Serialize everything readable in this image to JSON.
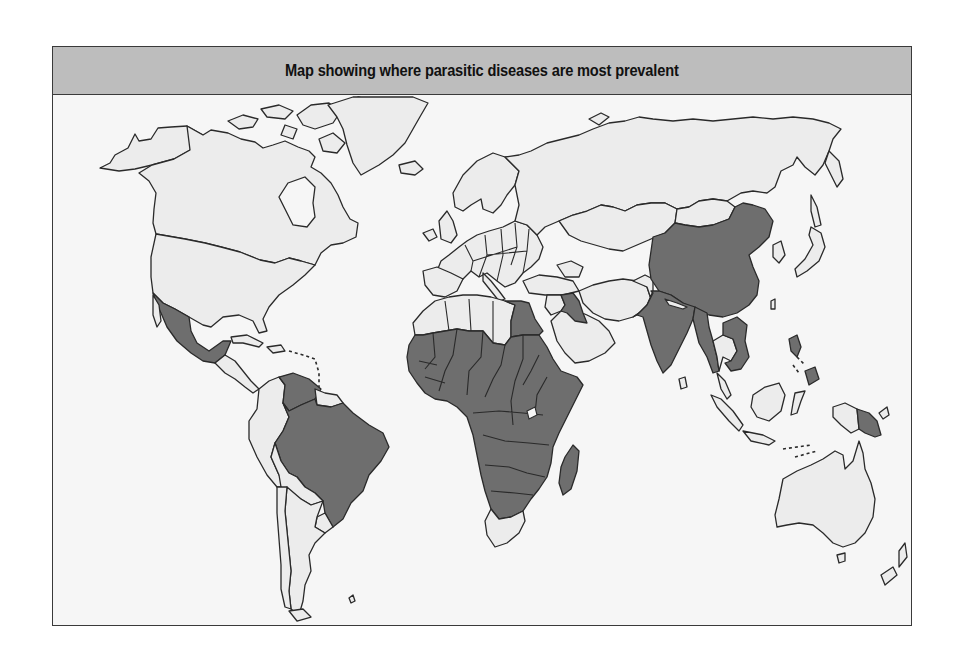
{
  "title": "Map showing where parasitic diseases are most prevalent",
  "map": {
    "projection": "world outline map",
    "legend": null,
    "colors": {
      "ocean": "#f6f6f6",
      "land_low_prevalence": "#ececec",
      "land_high_prevalence": "#6e6e6e",
      "header": "#bdbdbd",
      "outline": "#2a2a2a"
    },
    "high_prevalence_regions": [
      {
        "name": "Mexico",
        "continent": "North America"
      },
      {
        "name": "Venezuela",
        "continent": "South America"
      },
      {
        "name": "Brazil",
        "continent": "South America"
      },
      {
        "name": "Sub-Saharan Africa",
        "continent": "Africa"
      },
      {
        "name": "Egypt",
        "continent": "Africa"
      },
      {
        "name": "Madagascar",
        "continent": "Africa"
      },
      {
        "name": "Iraq",
        "continent": "Asia"
      },
      {
        "name": "India",
        "continent": "Asia"
      },
      {
        "name": "China",
        "continent": "Asia"
      },
      {
        "name": "Myanmar",
        "continent": "Asia"
      },
      {
        "name": "Cambodia / Vietnam",
        "continent": "Asia"
      },
      {
        "name": "Philippines",
        "continent": "Asia"
      },
      {
        "name": "Papua New Guinea",
        "continent": "Oceania"
      }
    ]
  }
}
